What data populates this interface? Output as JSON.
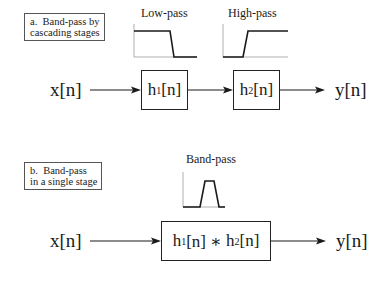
{
  "panel_a": {
    "label": "a.  Band-pass by\ncascading stages",
    "graphs": [
      {
        "title": "Low-pass",
        "shape": "low-pass"
      },
      {
        "title": "High-pass",
        "shape": "high-pass"
      }
    ],
    "input": "x[n]",
    "blocks": [
      {
        "name": "h",
        "sub": "1",
        "suffix": "[n]"
      },
      {
        "name": "h",
        "sub": "2",
        "suffix": "[n]"
      }
    ],
    "output": "y[n]"
  },
  "panel_b": {
    "label": "b.  Band-pass\nin a single stage",
    "graph": {
      "title": "Band-pass",
      "shape": "band-pass"
    },
    "input": "x[n]",
    "block": {
      "h1": "h",
      "sub1": "1",
      "mid": "[n] ∗ ",
      "h2": "h",
      "sub2": "2",
      "suffix": "[n]"
    },
    "output": "y[n]"
  },
  "colors": {
    "line": "#1a1a1a",
    "axis": "#888888",
    "box_border": "#555555"
  }
}
